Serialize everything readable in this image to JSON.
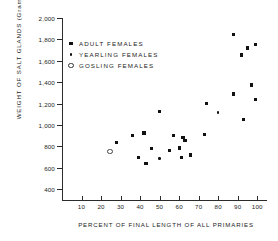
{
  "chart_data": {
    "type": "scatter",
    "title": "",
    "xlabel": "PERCENT OF FINAL LENGTH OF ALL PRIMARIES",
    "ylabel": "WEIGHT OF SALT GLANDS (Grams)",
    "xlim": [
      0,
      105
    ],
    "ylim": [
      300,
      2000
    ],
    "grid": false,
    "legend_position": "upper-left",
    "x_ticks": [
      10,
      20,
      30,
      40,
      50,
      60,
      70,
      80,
      90,
      100
    ],
    "x_tick_labels": [
      "10",
      "20",
      "30",
      "40",
      "50",
      "60",
      "70",
      "80",
      "90",
      "100"
    ],
    "y_ticks": [
      2000,
      1800,
      1600,
      1400,
      1200,
      1000,
      800,
      600,
      400
    ],
    "y_tick_labels": [
      "2,000",
      "1,800",
      "1,600",
      "1,400",
      "1,200",
      "1,000",
      "800",
      "600",
      "400"
    ],
    "series": [
      {
        "name": "ADULT FEMALES",
        "marker": "filled-square",
        "points": [
          [
            88,
            1845
          ],
          [
            95,
            1720
          ],
          [
            99,
            1755
          ],
          [
            92,
            1655
          ],
          [
            97,
            1375
          ],
          [
            88,
            1290
          ],
          [
            74,
            1200
          ],
          [
            99,
            1240
          ],
          [
            93,
            1055
          ],
          [
            73,
            915
          ],
          [
            50,
            1130
          ],
          [
            36,
            905
          ],
          [
            42,
            925
          ],
          [
            57,
            905
          ],
          [
            62,
            880
          ],
          [
            28,
            835
          ],
          [
            46,
            780
          ],
          [
            55,
            765
          ],
          [
            60,
            785
          ],
          [
            63,
            855
          ],
          [
            39,
            700
          ],
          [
            61,
            695
          ],
          [
            66,
            720
          ],
          [
            43,
            640
          ]
        ]
      },
      {
        "name": "YEARLING FEMALES",
        "marker": "filled-circle",
        "points": [
          [
            80,
            1120
          ],
          [
            50,
            690
          ]
        ]
      },
      {
        "name": "GOSLING FEMALES",
        "marker": "open-circle",
        "points": [
          [
            24,
            760
          ]
        ]
      }
    ]
  },
  "legend": {
    "items": [
      {
        "label": "ADULT   FEMALES",
        "marker": "filled-square"
      },
      {
        "label": "YEARLING   FEMALES",
        "marker": "filled-circle"
      },
      {
        "label": "GOSLING  FEMALES",
        "marker": "open-circle"
      }
    ]
  }
}
